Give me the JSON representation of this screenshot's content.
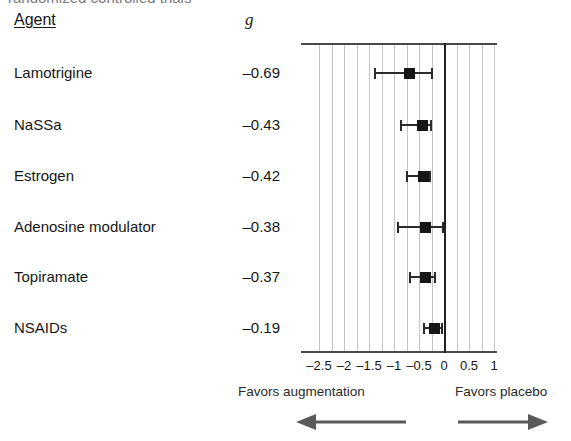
{
  "figure": {
    "top_cut_text": "randomized controlled trials",
    "columns": {
      "agent_header": "Agent",
      "effect_header": "g"
    },
    "axis": {
      "tick_labels": [
        "–2.5",
        "–2",
        "–1.5",
        "–1",
        "–0.5",
        "0",
        "0.5",
        "1"
      ],
      "tick_values": [
        -2.5,
        -2,
        -1.5,
        -1,
        -0.5,
        0,
        0.5,
        1
      ]
    },
    "footer": {
      "left_caption": "Favors augmentation",
      "right_caption": "Favors placebo",
      "left_arrow_icon": "arrow-left-icon",
      "right_arrow_icon": "arrow-right-icon"
    }
  },
  "chart_data": {
    "type": "forest",
    "title": "",
    "xlabel": "",
    "ylabel": "",
    "xlim": [
      -2.75,
      1.25
    ],
    "grid": true,
    "reference_line": 0,
    "effect_measure": "g",
    "categories": [
      "Lamotrigine",
      "NaSSa",
      "Estrogen",
      "Adenosine modulator",
      "Topiramate",
      "NSAIDs"
    ],
    "rows": [
      {
        "label": "Lamotrigine",
        "g": "–0.69",
        "value": -0.69,
        "ci_low": -1.38,
        "ci_high": -0.24
      },
      {
        "label": "NaSSa",
        "g": "–0.43",
        "value": -0.43,
        "ci_low": -0.86,
        "ci_high": -0.26
      },
      {
        "label": "Estrogen",
        "g": "–0.42",
        "value": -0.42,
        "ci_low": -0.74,
        "ci_high": -0.28
      },
      {
        "label": "Adenosine modulator",
        "g": "–0.38",
        "value": -0.38,
        "ci_low": -0.92,
        "ci_high": -0.02
      },
      {
        "label": "Topiramate",
        "g": "–0.37",
        "value": -0.37,
        "ci_low": -0.68,
        "ci_high": -0.18
      },
      {
        "label": "NSAIDs",
        "g": "–0.19",
        "value": -0.19,
        "ci_low": -0.4,
        "ci_high": -0.04
      }
    ]
  },
  "colors": {
    "marker": "#161616",
    "gridline": "#c4c4c4",
    "zeroline": "#222222",
    "frame": "#4a4a4a",
    "text": "#161616"
  }
}
